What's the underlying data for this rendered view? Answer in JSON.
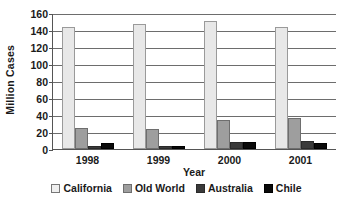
{
  "chart_data": {
    "type": "bar",
    "title": "",
    "xlabel": "Year",
    "ylabel": "Million Cases",
    "categories": [
      "1998",
      "1999",
      "2000",
      "2001"
    ],
    "ylim": [
      0,
      160
    ],
    "yticks": [
      0,
      20,
      40,
      60,
      80,
      100,
      120,
      140,
      160
    ],
    "grid": true,
    "legend_position": "bottom",
    "series": [
      {
        "name": "California",
        "color": "#e8e8e8",
        "values": [
          143,
          147,
          151,
          144
        ]
      },
      {
        "name": "Old World",
        "color": "#9e9e9e",
        "values": [
          25,
          23,
          34,
          37
        ]
      },
      {
        "name": "Australia",
        "color": "#3a3a3a",
        "values": [
          4,
          3,
          8,
          9
        ]
      },
      {
        "name": "Chile",
        "color": "#0a0a0a",
        "values": [
          7,
          4,
          8,
          7
        ]
      }
    ]
  }
}
